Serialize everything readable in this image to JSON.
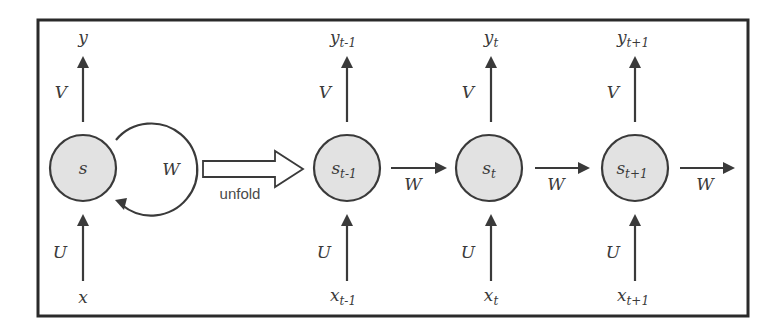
{
  "colors": {
    "node_fill": "#e2e2e2",
    "stroke": "#3a3a3a",
    "frame": "#2a2a2a",
    "background": "#ffffff"
  },
  "folded": {
    "node": {
      "label": "s",
      "subscript": ""
    },
    "input": {
      "label": "x",
      "subscript": ""
    },
    "output": {
      "label": "y",
      "subscript": ""
    },
    "input_weight": "U",
    "output_weight": "V",
    "recurrent_weight": "W"
  },
  "unfold_label": "unfold",
  "steps": [
    {
      "node": {
        "label": "s",
        "subscript": "t-1"
      },
      "input": {
        "label": "x",
        "subscript": "t-1"
      },
      "output": {
        "label": "y",
        "subscript": "t-1"
      },
      "input_weight": "U",
      "output_weight": "V",
      "next_weight": "W"
    },
    {
      "node": {
        "label": "s",
        "subscript": "t"
      },
      "input": {
        "label": "x",
        "subscript": "t"
      },
      "output": {
        "label": "y",
        "subscript": "t"
      },
      "input_weight": "U",
      "output_weight": "V",
      "next_weight": "W"
    },
    {
      "node": {
        "label": "s",
        "subscript": "t+1"
      },
      "input": {
        "label": "x",
        "subscript": "t+1"
      },
      "output": {
        "label": "y",
        "subscript": "t+1"
      },
      "input_weight": "U",
      "output_weight": "V",
      "next_weight": "W"
    }
  ]
}
